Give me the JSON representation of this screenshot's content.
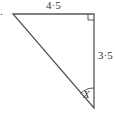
{
  "diagram": {
    "type": "right-triangle",
    "labels": {
      "top_side": "4·5",
      "right_side": "3·5",
      "angle": "X",
      "question_marker": "."
    },
    "colors": {
      "stroke": "#555555",
      "text": "#333333",
      "background": "#ffffff"
    }
  }
}
